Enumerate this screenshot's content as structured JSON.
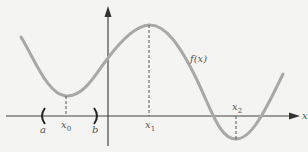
{
  "figure": {
    "function_label": "f(x)",
    "x_axis_label": "x",
    "labels": {
      "a": "a",
      "b": "b",
      "x0": "x",
      "x0_sub": "0",
      "x1": "x",
      "x1_sub": "1",
      "x2": "x",
      "x2_sub": "2"
    },
    "interval_brackets": {
      "left": "(",
      "right": ")"
    },
    "colors": {
      "curve": "#a8a8a8",
      "axes": "#444444",
      "dashed": "#555555",
      "background": "#f4f4f2"
    }
  }
}
